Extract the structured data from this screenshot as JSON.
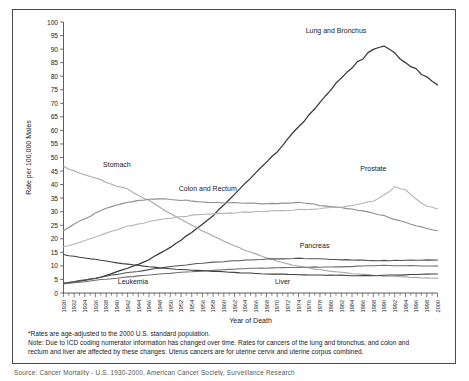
{
  "figure": {
    "title": "",
    "axis_label_y": "Rate per 100,000 Males",
    "axis_label_x": "Year of Death",
    "footnote_1": "*Rates are age-adjusted to the 2000 U.S. standard population.",
    "footnote_2": "Note: Due to ICD coding numerator information has changed over time. Rates for cancers of the lung and bronchus, and colon and",
    "footnote_3": "rectum and liver are affected by these changes. Uterus cancers are for uterine cervix and uterine corpus combined.",
    "source_line": "Source: Cancer Mortality - U.S. 1930-2000, American Cancer Society, Surveillance Research"
  },
  "chart_data": {
    "type": "line",
    "title": "",
    "xlabel": "Year of Death",
    "ylabel": "Rate per 100,000 Males",
    "xlim": [
      1930,
      2000
    ],
    "ylim": [
      0,
      100
    ],
    "ytick_step": 5,
    "xtick_step": 2,
    "grid": false,
    "legend": "inline-annotations",
    "ytick_labels": [
      "0",
      "5",
      "10",
      "15",
      "20",
      "25",
      "30",
      "35",
      "40",
      "45",
      "50",
      "55",
      "60",
      "65",
      "70",
      "75",
      "80",
      "85",
      "90",
      "95",
      "100"
    ],
    "xtick_labels": [
      "1930",
      "1932",
      "1934",
      "1936",
      "1938",
      "1940",
      "1942",
      "1944",
      "1946",
      "1948",
      "1950",
      "1952",
      "1954",
      "1956",
      "1958",
      "1960",
      "1962",
      "1964",
      "1966",
      "1968",
      "1970",
      "1972",
      "1974",
      "1976",
      "1978",
      "1980",
      "1982",
      "1984",
      "1986",
      "1988",
      "1990",
      "1992",
      "1994",
      "1996",
      "1998",
      "2000"
    ],
    "x": [
      1930,
      1932,
      1934,
      1936,
      1938,
      1940,
      1942,
      1944,
      1946,
      1948,
      1950,
      1952,
      1954,
      1956,
      1958,
      1960,
      1962,
      1964,
      1966,
      1968,
      1970,
      1972,
      1974,
      1976,
      1978,
      1980,
      1982,
      1984,
      1986,
      1988,
      1990,
      1992,
      1994,
      1996,
      1998,
      2000
    ],
    "series": [
      {
        "name": "Lung and Bronchus",
        "color": "#3a3a3a",
        "width": 1.25,
        "label_x": 1980,
        "label_y": 96,
        "values": [
          3.5,
          4.0,
          4.6,
          5.3,
          6.3,
          7.5,
          8.7,
          10.0,
          11.6,
          13.6,
          15.6,
          18.0,
          20.4,
          23.0,
          25.7,
          28.9,
          32.4,
          35.6,
          38.8,
          42.0,
          45.0,
          48.6,
          52.0,
          55.5,
          58.9,
          62.4,
          65.5,
          68.2,
          70.7,
          72.8,
          73.7,
          73.0,
          71.5,
          69.5,
          67.6,
          65.8
        ],
        "peak_year": 1990,
        "peak_value": 91.6,
        "end_value": 76.8
      },
      {
        "name": "Stomach",
        "color": "#a8a8a8",
        "width": 1.1,
        "label_x": 1942,
        "label_y": 46,
        "values": [
          46.5,
          45.0,
          43.5,
          42.3,
          41.0,
          39.6,
          38.2,
          36.0,
          34.2,
          31.7,
          29.2,
          27.0,
          25.0,
          23.0,
          21.0,
          19.2,
          17.4,
          15.8,
          14.4,
          13.0,
          11.8,
          10.7,
          9.9,
          9.2,
          8.6,
          8.0,
          7.6,
          7.2,
          6.9,
          6.6,
          6.3,
          6.1,
          5.9,
          5.7,
          5.6,
          5.5
        ]
      },
      {
        "name": "Colon and Rectum",
        "color": "#8e8e8e",
        "width": 1.1,
        "label_x": 1958,
        "label_y": 37.5,
        "values": [
          23.0,
          25.5,
          27.3,
          29.5,
          31.3,
          32.6,
          33.4,
          34.1,
          34.5,
          34.8,
          34.7,
          34.3,
          34.0,
          33.7,
          33.5,
          33.3,
          33.2,
          33.1,
          33.0,
          33.0,
          33.1,
          33.2,
          33.3,
          33.0,
          32.4,
          32.0,
          31.5,
          31.0,
          30.3,
          29.5,
          28.5,
          27.2,
          26.0,
          24.8,
          23.8,
          23.0
        ]
      },
      {
        "name": "Prostate",
        "color": "#b5b5b5",
        "width": 1.1,
        "label_x": 1989,
        "label_y": 44,
        "values": [
          17.0,
          18.0,
          19.3,
          20.8,
          22.0,
          23.4,
          24.6,
          25.4,
          26.3,
          27.0,
          27.6,
          28.1,
          28.6,
          29.0,
          29.2,
          29.4,
          29.6,
          29.8,
          30.0,
          30.2,
          30.3,
          30.6,
          30.8,
          31.0,
          31.2,
          31.5,
          31.8,
          32.2,
          33.0,
          34.0,
          36.0,
          39.2,
          38.0,
          34.5,
          32.0,
          31.0
        ],
        "peak_year": 1992,
        "peak_value": 39.2
      },
      {
        "name": "Pancreas",
        "color": "#555555",
        "width": 1.1,
        "label_x": 1978,
        "label_y": 16,
        "values": [
          3.6,
          4.2,
          4.9,
          5.5,
          6.2,
          6.9,
          7.5,
          8.0,
          8.6,
          9.2,
          9.8,
          10.2,
          10.6,
          11.0,
          11.4,
          11.6,
          11.9,
          12.1,
          12.3,
          12.5,
          12.6,
          12.7,
          12.8,
          12.7,
          12.6,
          12.4,
          12.3,
          12.2,
          12.1,
          12.0,
          12.0,
          12.0,
          12.1,
          12.1,
          12.2,
          12.2
        ]
      },
      {
        "name": "Leukemia",
        "color": "#6e6e6e",
        "width": 1.1,
        "label_x": 1946,
        "label_y": 3.2,
        "values": [
          3.4,
          3.8,
          4.2,
          4.7,
          5.1,
          5.5,
          5.9,
          6.3,
          6.7,
          7.0,
          7.3,
          7.6,
          7.9,
          8.1,
          8.4,
          8.6,
          8.8,
          9.0,
          9.1,
          9.2,
          9.3,
          9.4,
          9.5,
          9.5,
          9.6,
          9.6,
          9.7,
          9.8,
          9.9,
          10.0,
          10.1,
          10.1,
          10.1,
          10.0,
          10.0,
          9.9
        ]
      },
      {
        "name": "Liver",
        "color": "#3f3f3f",
        "width": 1.1,
        "label_x": 1972,
        "label_y": 3.2,
        "values": [
          14.1,
          13.5,
          13.0,
          12.4,
          11.8,
          11.2,
          10.6,
          10.2,
          9.7,
          9.3,
          9.0,
          8.7,
          8.4,
          8.2,
          8.0,
          7.8,
          7.6,
          7.4,
          7.2,
          7.1,
          7.0,
          6.9,
          6.8,
          6.7,
          6.6,
          6.6,
          6.5,
          6.4,
          6.4,
          6.4,
          6.5,
          6.6,
          6.7,
          6.8,
          6.9,
          7.0
        ]
      }
    ],
    "annotations": [
      {
        "text": "Lung and Bronchus",
        "x": 1981,
        "y": 96
      },
      {
        "text": "Stomach",
        "x": 1940,
        "y": 46.5
      },
      {
        "text": "Colon and Rectum",
        "x": 1957,
        "y": 37.5
      },
      {
        "text": "Prostate",
        "x": 1988,
        "y": 45
      },
      {
        "text": "Pancreas",
        "x": 1977,
        "y": 16.5
      },
      {
        "text": "Leukemia",
        "x": 1943,
        "y": 3.4
      },
      {
        "text": "Liver",
        "x": 1971,
        "y": 3.4
      }
    ]
  }
}
